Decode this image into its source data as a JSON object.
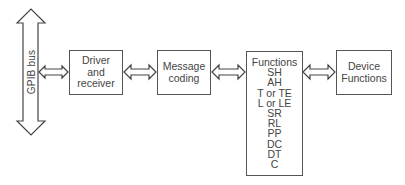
{
  "diagram": {
    "type": "block-diagram",
    "bus": {
      "label": "GPIB bus",
      "direction": "bidirectional-vertical"
    },
    "blocks": [
      {
        "id": "driver",
        "lines": [
          "Driver",
          "and",
          "receiver"
        ]
      },
      {
        "id": "message",
        "lines": [
          "Message",
          "coding"
        ]
      },
      {
        "id": "functions",
        "lines": [
          "Functions",
          "SH",
          "AH",
          "T or TE",
          "L or LE",
          "SR",
          "RL",
          "PP",
          "DC",
          "DT",
          "C"
        ]
      },
      {
        "id": "device",
        "lines": [
          "Device",
          "Functions"
        ]
      }
    ],
    "connections": [
      {
        "from": "bus",
        "to": "driver",
        "type": "double-arrow"
      },
      {
        "from": "driver",
        "to": "message",
        "type": "double-arrow"
      },
      {
        "from": "message",
        "to": "functions",
        "type": "double-arrow"
      },
      {
        "from": "functions",
        "to": "device",
        "type": "double-arrow"
      }
    ],
    "colors": {
      "stroke": "#444444",
      "text": "#444444",
      "background": "#ffffff"
    }
  }
}
